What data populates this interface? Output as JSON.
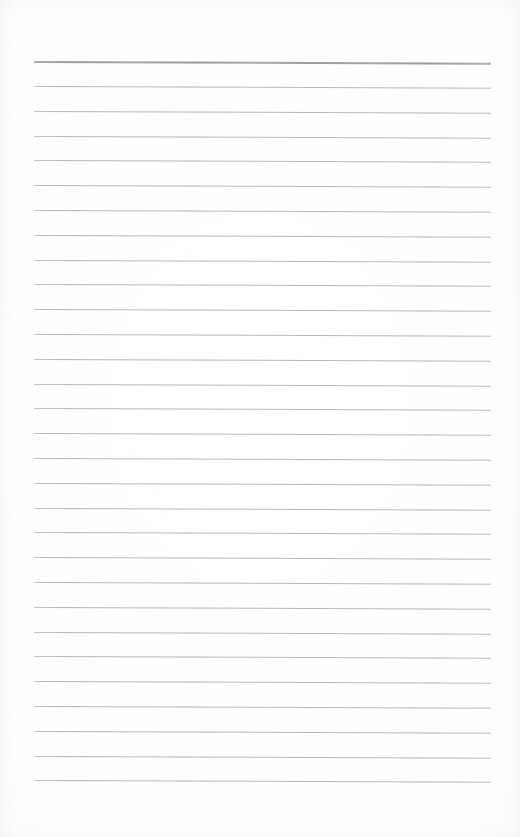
{
  "document": {
    "type": "blank-ruled-notepad-page",
    "title": "Blank Ruled Page",
    "orientation": "portrait",
    "page_width_px": 520,
    "page_height_px": 837,
    "background_color": "#fdfdfd",
    "has_text_content": false,
    "visible_text": "",
    "margin_rule_present": false,
    "hole_punches_present": false
  },
  "ruling": {
    "line_color": "#b4b4b4",
    "header_line_color": "#9a9a9a",
    "line_count": 30,
    "line_left_x": 34,
    "line_right_x": 491,
    "line_length_px": 457,
    "first_line_y": 61,
    "last_line_y": 780,
    "line_spacing_px": 24.8,
    "line_thickness_px": 1,
    "header_line_thickness_px": 2,
    "skew_deg": 0.22,
    "lines": [
      {
        "index": 1,
        "y": 61,
        "emphasis": "header"
      },
      {
        "index": 2,
        "y": 86,
        "emphasis": "normal"
      },
      {
        "index": 3,
        "y": 111,
        "emphasis": "normal"
      },
      {
        "index": 4,
        "y": 136,
        "emphasis": "normal"
      },
      {
        "index": 5,
        "y": 160,
        "emphasis": "normal"
      },
      {
        "index": 6,
        "y": 185,
        "emphasis": "normal"
      },
      {
        "index": 7,
        "y": 210,
        "emphasis": "normal"
      },
      {
        "index": 8,
        "y": 235,
        "emphasis": "normal"
      },
      {
        "index": 9,
        "y": 260,
        "emphasis": "normal"
      },
      {
        "index": 10,
        "y": 284,
        "emphasis": "normal"
      },
      {
        "index": 11,
        "y": 309,
        "emphasis": "normal"
      },
      {
        "index": 12,
        "y": 334,
        "emphasis": "normal"
      },
      {
        "index": 13,
        "y": 359,
        "emphasis": "normal"
      },
      {
        "index": 14,
        "y": 384,
        "emphasis": "normal"
      },
      {
        "index": 15,
        "y": 408,
        "emphasis": "normal"
      },
      {
        "index": 16,
        "y": 433,
        "emphasis": "normal"
      },
      {
        "index": 17,
        "y": 458,
        "emphasis": "normal"
      },
      {
        "index": 18,
        "y": 483,
        "emphasis": "normal"
      },
      {
        "index": 19,
        "y": 508,
        "emphasis": "normal"
      },
      {
        "index": 20,
        "y": 532,
        "emphasis": "normal"
      },
      {
        "index": 21,
        "y": 557,
        "emphasis": "normal"
      },
      {
        "index": 22,
        "y": 582,
        "emphasis": "normal"
      },
      {
        "index": 23,
        "y": 607,
        "emphasis": "normal"
      },
      {
        "index": 24,
        "y": 632,
        "emphasis": "normal"
      },
      {
        "index": 25,
        "y": 656,
        "emphasis": "normal"
      },
      {
        "index": 26,
        "y": 681,
        "emphasis": "normal"
      },
      {
        "index": 27,
        "y": 706,
        "emphasis": "normal"
      },
      {
        "index": 28,
        "y": 731,
        "emphasis": "normal"
      },
      {
        "index": 29,
        "y": 756,
        "emphasis": "normal"
      },
      {
        "index": 30,
        "y": 780,
        "emphasis": "normal"
      }
    ]
  }
}
